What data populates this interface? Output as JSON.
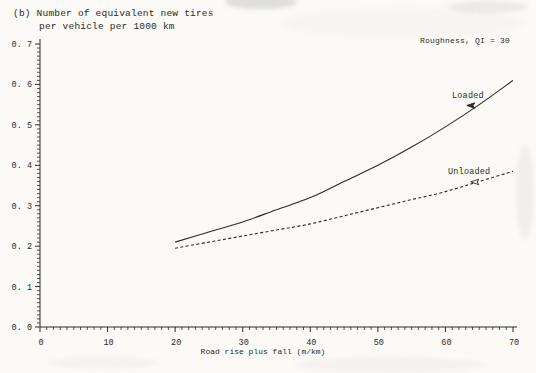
{
  "title": {
    "line1": "(b) Number of equivalent new tires",
    "line2": "per vehicle per 1000 km"
  },
  "chart_data": {
    "type": "line",
    "title": "(b) Number of equivalent new tires per vehicle per 1000 km",
    "annotation": "Roughness, QI = 30",
    "xlabel": "Road rise plus fall (m/km)",
    "ylabel": "Number of equivalent new tires per vehicle per 1000 km",
    "xlim": [
      0,
      70
    ],
    "ylim": [
      0,
      0.7
    ],
    "x_major_step": 10,
    "x_minor_step": 1,
    "y_major_step": 0.1,
    "y_minor_step": 0.01,
    "x_tick_labels": [
      "0",
      "10",
      "20",
      "30",
      "40",
      "50",
      "60",
      "70"
    ],
    "y_tick_labels": [
      "0. 0",
      "0. 1",
      "0. 2",
      "0. 3",
      "0. 4",
      "0. 5",
      "0. 6",
      "0. 7"
    ],
    "grid": false,
    "legend_position": "inline-labels",
    "x": [
      20,
      25,
      30,
      35,
      40,
      45,
      50,
      55,
      60,
      65,
      70
    ],
    "series": [
      {
        "name": "Loaded",
        "line_style": "solid",
        "marker": "filled-dart",
        "values": [
          0.21,
          0.235,
          0.26,
          0.29,
          0.32,
          0.36,
          0.4,
          0.445,
          0.495,
          0.55,
          0.61
        ],
        "marker_point": {
          "x": 63.9,
          "y": 0.548
        }
      },
      {
        "name": "Unloaded",
        "line_style": "dashed",
        "marker": "open-dart",
        "values": [
          0.195,
          0.21,
          0.225,
          0.24,
          0.255,
          0.275,
          0.295,
          0.315,
          0.335,
          0.36,
          0.385
        ],
        "marker_point": {
          "x": 64.5,
          "y": 0.359
        }
      }
    ],
    "colors": {
      "ink": "#2b2b2b",
      "paper": "#fbfaf6"
    }
  }
}
